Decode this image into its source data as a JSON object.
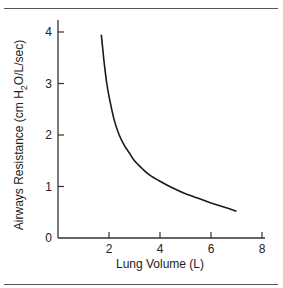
{
  "chart_data": {
    "type": "line",
    "title": "",
    "xlabel": "Lung Volume (L)",
    "ylabel": "Airways Resistance (cm H2O/L/sec)",
    "ylabel_parts": {
      "before": "Airways Resistance (cm H",
      "sub": "2",
      "after": "O/L/sec)"
    },
    "xlim": [
      0,
      8
    ],
    "ylim": [
      0,
      4
    ],
    "x_ticks": [
      2,
      4,
      6,
      8
    ],
    "y_ticks": [
      0,
      1,
      2,
      3,
      4
    ],
    "grid": false,
    "legend": null,
    "series": [
      {
        "name": "Airways Resistance",
        "color": "#1a1a1a",
        "x": [
          1.7,
          1.8,
          1.9,
          2.0,
          2.2,
          2.4,
          2.6,
          2.8,
          3.0,
          3.3,
          3.6,
          4.0,
          4.5,
          5.0,
          5.5,
          6.0,
          6.5,
          7.0
        ],
        "y": [
          3.95,
          3.45,
          3.05,
          2.75,
          2.3,
          2.0,
          1.8,
          1.65,
          1.5,
          1.35,
          1.22,
          1.1,
          0.97,
          0.86,
          0.77,
          0.68,
          0.6,
          0.52
        ]
      }
    ]
  },
  "layout": {
    "rule_color": "#555555"
  }
}
